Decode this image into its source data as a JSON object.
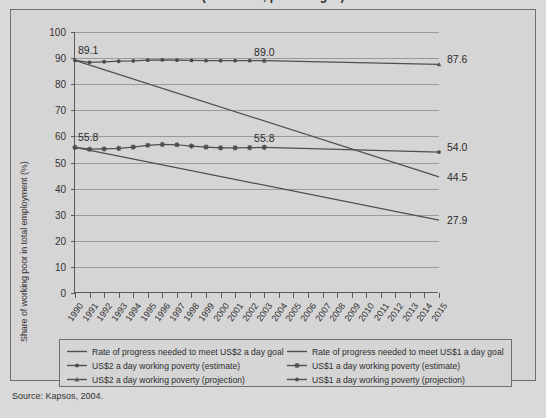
{
  "title_sliver": "(1990-2015, percentages)",
  "source_note": "Source: Kapsos, 2004.",
  "axis": {
    "ylabel": "Share of working poor in total employment (%)",
    "yticks": [
      "0",
      "10",
      "20",
      "30",
      "40",
      "50",
      "60",
      "70",
      "80",
      "90",
      "100"
    ],
    "xticks": [
      "1990",
      "1991",
      "1992",
      "1993",
      "1994",
      "1995",
      "1996",
      "1997",
      "1998",
      "1999",
      "2000",
      "2001",
      "2002",
      "2003",
      "2004",
      "2005",
      "2006",
      "2007",
      "2008",
      "2009",
      "2010",
      "2011",
      "2012",
      "2013",
      "2014",
      "2015"
    ]
  },
  "annotations": {
    "us2_start": "89.1",
    "us1_start": "55.8",
    "us2_mid": "89.0",
    "us1_mid": "55.8",
    "us2_proj_end": "87.6",
    "us1_proj_end": "54.0",
    "us2_goal_end": "44.5",
    "us1_goal_end": "27.9"
  },
  "legend": {
    "left": [
      {
        "label": "Rate of progress needed to meet US$2 a day goal",
        "marker": "line-plain"
      },
      {
        "label": "US$2 a day working poverty (estimate)",
        "marker": "line-dot"
      },
      {
        "label": "US$2 a day working poverty (projection)",
        "marker": "line-triangle"
      }
    ],
    "right": [
      {
        "label": "Rate of progress needed to meet US$1 a day goal",
        "marker": "line-plain"
      },
      {
        "label": "US$1 a day working poverty (estimate)",
        "marker": "line-star"
      },
      {
        "label": "US$1 a day working poverty (projection)",
        "marker": "line-dot"
      }
    ]
  },
  "chart_data": {
    "type": "line",
    "title": "(1990-2015, percentages)",
    "xlabel": "",
    "ylabel": "Share of working poor in total employment (%)",
    "xlim": [
      1990,
      2015
    ],
    "ylim": [
      0,
      100
    ],
    "grid": true,
    "legend_position": "bottom",
    "x": [
      1990,
      1991,
      1992,
      1993,
      1994,
      1995,
      1996,
      1997,
      1998,
      1999,
      2000,
      2001,
      2002,
      2003,
      2004,
      2005,
      2006,
      2007,
      2008,
      2009,
      2010,
      2011,
      2012,
      2013,
      2014,
      2015
    ],
    "series": [
      {
        "name": "US$2 a day working poverty (estimate)",
        "type": "line",
        "marker": "dot",
        "x": [
          1990,
          1991,
          1992,
          1993,
          1994,
          1995,
          1996,
          1997,
          1998,
          1999,
          2000,
          2001,
          2002,
          2003
        ],
        "values": [
          89.1,
          88.4,
          88.6,
          88.8,
          88.9,
          89.2,
          89.3,
          89.2,
          89.1,
          89.0,
          89.0,
          89.0,
          89.0,
          89.0
        ]
      },
      {
        "name": "US$2 a day working poverty (projection)",
        "type": "line",
        "marker": "triangle",
        "x": [
          2003,
          2015
        ],
        "values": [
          89.0,
          87.6
        ]
      },
      {
        "name": "Rate of progress needed to meet US$2 a day goal",
        "type": "line",
        "marker": "none",
        "x": [
          1990,
          2015
        ],
        "values": [
          89.1,
          44.5
        ]
      },
      {
        "name": "US$1 a day working poverty (estimate)",
        "type": "line",
        "marker": "star",
        "x": [
          1990,
          1991,
          1992,
          1993,
          1994,
          1995,
          1996,
          1997,
          1998,
          1999,
          2000,
          2001,
          2002,
          2003
        ],
        "values": [
          55.8,
          55.1,
          55.2,
          55.4,
          55.9,
          56.6,
          56.9,
          56.8,
          56.3,
          55.9,
          55.6,
          55.6,
          55.7,
          55.8
        ]
      },
      {
        "name": "US$1 a day working poverty (projection)",
        "type": "line",
        "marker": "dot",
        "x": [
          2003,
          2015
        ],
        "values": [
          55.8,
          54.0
        ]
      },
      {
        "name": "Rate of progress needed to meet US$1 a day goal",
        "type": "line",
        "marker": "none",
        "x": [
          1990,
          2015
        ],
        "values": [
          55.8,
          27.9
        ]
      }
    ]
  }
}
